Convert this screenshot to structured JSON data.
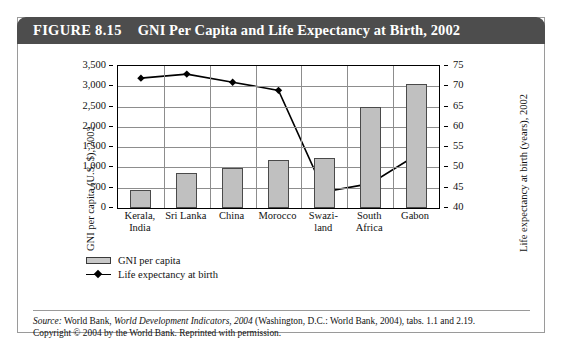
{
  "figure": {
    "number": "FIGURE 8.15",
    "title": "GNI Per Capita and Life Expectancy at Birth, 2002"
  },
  "source": {
    "label": "Source:",
    "line1_a": " World Bank, ",
    "line1_italic": "World Development Indicators, 2004",
    "line1_b": " (Washington, D.C.: World Bank, 2004), tabs. 1.1 and 2.19.",
    "line2": "Copyright © 2004 by the World Bank. Reprinted with permission."
  },
  "legend": {
    "bar_label": "GNI per capita",
    "line_label": "Life expectancy at birth"
  },
  "colors": {
    "header_bar": "#4d4d4d",
    "bar_fill": "#c0c0c0",
    "bar_border": "#4a4a4a",
    "line": "#000000",
    "gridline": "#8d8d8d",
    "frame": "#9a9a9a"
  },
  "chart_data": {
    "type": "bar",
    "title": "GNI Per Capita and Life Expectancy at Birth, 2002",
    "categories": [
      "Kerala, India",
      "Sri Lanka",
      "China",
      "Morocco",
      "Swazi-land",
      "South Africa",
      "Gabon"
    ],
    "category_lines": [
      [
        "Kerala,",
        "India"
      ],
      [
        "Sri Lanka"
      ],
      [
        "China"
      ],
      [
        "Morocco"
      ],
      [
        "Swazi-",
        "land"
      ],
      [
        "South",
        "Africa"
      ],
      [
        "Gabon"
      ]
    ],
    "xlabel": "",
    "grid": true,
    "legend_position": "below-left",
    "series": [
      {
        "name": "GNI per capita",
        "type": "bar",
        "axis": "left",
        "values": [
          440,
          860,
          980,
          1180,
          1240,
          2500,
          3060
        ]
      },
      {
        "name": "Life expectancy at birth",
        "type": "line",
        "axis": "right",
        "values": [
          72,
          73,
          71,
          69,
          44,
          46,
          53
        ]
      }
    ],
    "left_axis": {
      "label": "GNI per capita (U.S. $), 2002",
      "min": 0,
      "max": 3500,
      "step": 500,
      "ticks": [
        "0",
        "500",
        "1,000",
        "1,500",
        "2,000",
        "2,500",
        "3,000",
        "3,500"
      ]
    },
    "right_axis": {
      "label": "Life expectancy at birth (years), 2002",
      "min": 40,
      "max": 75,
      "step": 5,
      "ticks": [
        "40",
        "45",
        "50",
        "55",
        "60",
        "65",
        "70",
        "75"
      ]
    }
  }
}
